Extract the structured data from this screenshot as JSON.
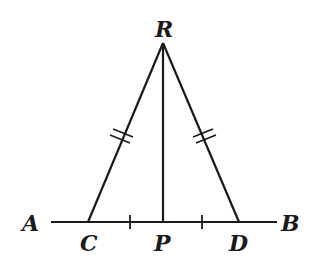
{
  "diagram": {
    "type": "geometry",
    "colors": {
      "stroke": "#1a1a1a",
      "background": "#ffffff"
    },
    "points": {
      "R": {
        "label": "R",
        "x": 163,
        "y": 43
      },
      "A": {
        "label": "A",
        "x": 51,
        "y": 222
      },
      "B": {
        "label": "B",
        "x": 277,
        "y": 222
      },
      "C": {
        "label": "C",
        "x": 88,
        "y": 222
      },
      "P": {
        "label": "P",
        "x": 163,
        "y": 222
      },
      "D": {
        "label": "D",
        "x": 239,
        "y": 222
      }
    },
    "labels": {
      "R": "R",
      "A": "A",
      "B": "B",
      "C": "C",
      "P": "P",
      "D": "D"
    },
    "segments": [
      {
        "name": "AB",
        "from": "A",
        "to": "B"
      },
      {
        "name": "RC",
        "from": "R",
        "to": "C"
      },
      {
        "name": "RD",
        "from": "R",
        "to": "D"
      },
      {
        "name": "RP",
        "from": "R",
        "to": "P"
      }
    ],
    "congruence_marks": [
      {
        "segment": "RC",
        "ticks": 2
      },
      {
        "segment": "RD",
        "ticks": 2
      },
      {
        "segment": "CP",
        "ticks": 1
      },
      {
        "segment": "PD",
        "ticks": 1
      }
    ]
  }
}
